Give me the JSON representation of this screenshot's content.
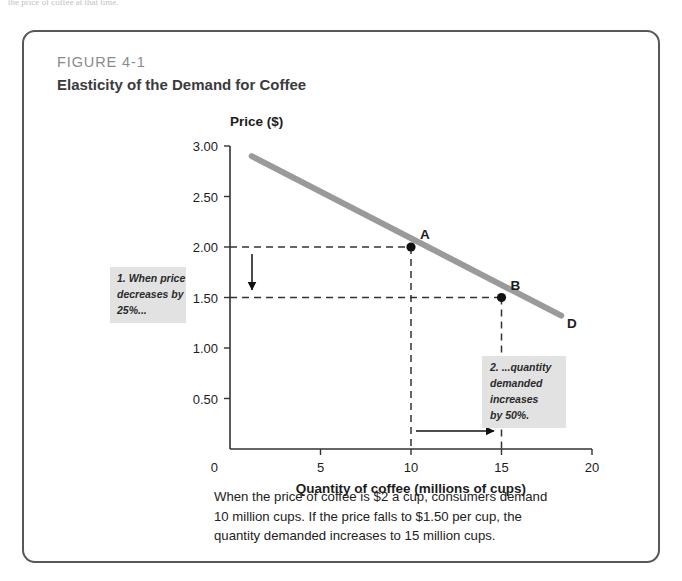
{
  "page_top_text": "the price of coffee at that time.",
  "figure": {
    "number": "FIGURE 4-1",
    "title": "Elasticity of the Demand for Coffee"
  },
  "caption": {
    "line1": "When the price of coffee is $2 a cup, consumers demand",
    "line2": "10 million cups. If the price falls to $1.50 per cup, the",
    "line3": "quantity demanded increases to 15 million cups."
  },
  "annotations": {
    "note1": {
      "line1": "1. When price",
      "line2": "decreases by",
      "line3": "25%..."
    },
    "note2": {
      "line1": "2. ...quantity",
      "line2": "demanded",
      "line3": "increases",
      "line4": "by 50%."
    }
  },
  "colors": {
    "frame": "#585858",
    "curve": "#9a9a9a",
    "axis": "#333333",
    "note_bg": "#e2e2e2",
    "text": "#222222",
    "figure_number": "#8a8a8a"
  },
  "chart_data": {
    "type": "line",
    "title": "Elasticity of the Demand for Coffee",
    "xlabel": "Quantity of coffee (millions of cups)",
    "ylabel": "Price ($)",
    "xlim": [
      0,
      20
    ],
    "ylim": [
      0,
      3.0
    ],
    "grid": false,
    "xticks": [
      0,
      5,
      10,
      15,
      20
    ],
    "xtick_labels": [
      "0",
      "5",
      "10",
      "15",
      "20"
    ],
    "yticks": [
      0.5,
      1.0,
      1.5,
      2.0,
      2.5,
      3.0
    ],
    "ytick_labels": [
      "0.50",
      "1.00",
      "1.50",
      "2.00",
      "2.50",
      "3.00"
    ],
    "series": [
      {
        "name": "D",
        "label": "D",
        "x": [
          1.2,
          18.3
        ],
        "y": [
          2.9,
          1.32
        ]
      }
    ],
    "points": [
      {
        "label": "A",
        "x": 10,
        "y": 2.0
      },
      {
        "label": "B",
        "x": 15,
        "y": 1.5
      }
    ],
    "guide_lines": [
      {
        "from": [
          0,
          2.0
        ],
        "to": [
          10,
          2.0
        ],
        "style": "dashed"
      },
      {
        "from": [
          10,
          2.0
        ],
        "to": [
          10,
          0
        ],
        "style": "dashed"
      },
      {
        "from": [
          0,
          1.5
        ],
        "to": [
          15,
          1.5
        ],
        "style": "dashed"
      },
      {
        "from": [
          15,
          1.5
        ],
        "to": [
          15,
          0
        ],
        "style": "dashed"
      }
    ],
    "arrows": [
      {
        "name": "price-decrease-arrow",
        "from": [
          1.2,
          1.95
        ],
        "to": [
          1.2,
          1.56
        ],
        "direction": "down"
      },
      {
        "name": "quantity-increase-arrow",
        "from": [
          10.3,
          0.22
        ],
        "to": [
          14.8,
          0.22
        ],
        "direction": "right"
      }
    ]
  }
}
